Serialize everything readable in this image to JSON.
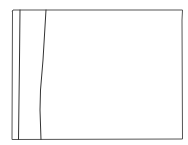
{
  "sketch": {
    "description": "Hand-drawn wireframe: outer frame with two narrow left columns",
    "stroke_color": "#3a3a3a",
    "background": "#ffffff",
    "frame": {
      "x1": 12,
      "y1": 10,
      "x2": 183,
      "y2": 140
    },
    "columns": [
      {
        "name": "narrow-left-strip",
        "top_x": 20,
        "bottom_x": 18
      },
      {
        "name": "sidebar-panel",
        "top_x": 46,
        "mid_x": 40,
        "bottom_x": 41
      }
    ]
  }
}
